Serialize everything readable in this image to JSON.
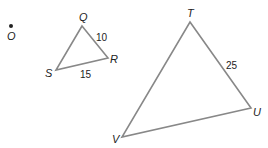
{
  "diagram": {
    "center_point": {
      "label": "O"
    },
    "small_triangle": {
      "vertices": {
        "Q": "Q",
        "R": "R",
        "S": "S"
      },
      "sides": {
        "QR": "10",
        "SR": "15"
      }
    },
    "large_triangle": {
      "vertices": {
        "T": "T",
        "U": "U",
        "V": "V"
      },
      "sides": {
        "TU": "25"
      }
    },
    "colors": {
      "stroke": "#888888",
      "text": "#222222"
    }
  }
}
